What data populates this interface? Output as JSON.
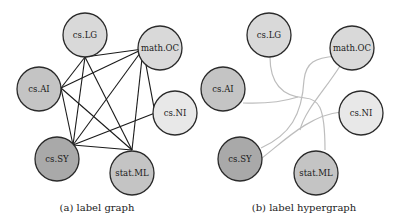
{
  "colors": {
    "shade_dark": "#a9a9a9",
    "shade_medium": "#c4c4c4",
    "shade_light": "#d9d9d9",
    "shade_lightest": "#e8e8e8",
    "edge": "#1a1a1a",
    "hyperedge": "#bdbdbd"
  },
  "panels": [
    {
      "id": "a",
      "caption": "(a) label graph",
      "nodes": [
        {
          "label": "cs.LG",
          "shade": "light"
        },
        {
          "label": "math.OC",
          "shade": "light"
        },
        {
          "label": "cs.AI",
          "shade": "medium"
        },
        {
          "label": "cs.NI",
          "shade": "lightest"
        },
        {
          "label": "cs.SY",
          "shade": "dark"
        },
        {
          "label": "stat.ML",
          "shade": "medium"
        }
      ],
      "edges": [
        [
          "cs.LG",
          "math.OC"
        ],
        [
          "cs.LG",
          "cs.AI"
        ],
        [
          "cs.LG",
          "cs.SY"
        ],
        [
          "cs.LG",
          "stat.ML"
        ],
        [
          "math.OC",
          "cs.AI"
        ],
        [
          "math.OC",
          "cs.NI"
        ],
        [
          "math.OC",
          "cs.SY"
        ],
        [
          "math.OC",
          "stat.ML"
        ],
        [
          "cs.AI",
          "cs.SY"
        ],
        [
          "cs.AI",
          "stat.ML"
        ],
        [
          "cs.NI",
          "cs.SY"
        ],
        [
          "cs.SY",
          "stat.ML"
        ]
      ]
    },
    {
      "id": "b",
      "caption": "(b) label hypergraph",
      "nodes": [
        {
          "label": "cs.LG",
          "shade": "light"
        },
        {
          "label": "math.OC",
          "shade": "light"
        },
        {
          "label": "cs.AI",
          "shade": "medium"
        },
        {
          "label": "cs.NI",
          "shade": "lightest"
        },
        {
          "label": "cs.SY",
          "shade": "dark"
        },
        {
          "label": "stat.ML",
          "shade": "medium"
        }
      ],
      "hyperedges": [
        [
          "cs.LG",
          "cs.AI",
          "stat.ML"
        ],
        [
          "math.OC",
          "cs.SY"
        ],
        [
          "cs.NI",
          "cs.SY"
        ]
      ]
    }
  ]
}
